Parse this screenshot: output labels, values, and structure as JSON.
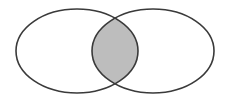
{
  "diagram": {
    "type": "venn",
    "sets": [
      {
        "name": "left-set",
        "cx": 77,
        "cy": 51,
        "rx": 61,
        "ry": 42
      },
      {
        "name": "right-set",
        "cx": 153,
        "cy": 51,
        "rx": 61,
        "ry": 42
      }
    ],
    "highlight": "intersection",
    "colors": {
      "background": "#ffffff",
      "stroke": "#3a3a3a",
      "intersection_fill": "#bdbdbd"
    }
  }
}
